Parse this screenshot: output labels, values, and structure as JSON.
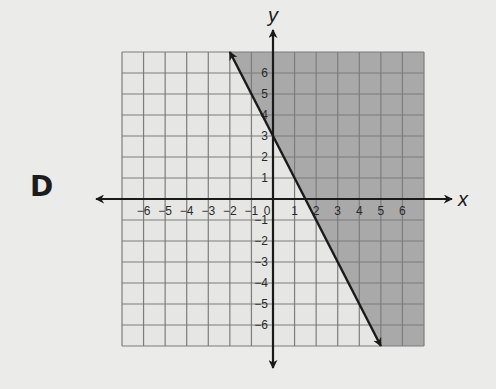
{
  "option_label": "D",
  "chart_data": {
    "type": "line",
    "title": "",
    "xlabel": "x",
    "ylabel": "y",
    "xlim": [
      -7,
      7
    ],
    "ylim": [
      -7,
      7
    ],
    "grid": true,
    "x_ticks": [
      -6,
      -5,
      -4,
      -3,
      -2,
      -1,
      0,
      1,
      2,
      3,
      4,
      5,
      6
    ],
    "y_ticks": [
      -6,
      -5,
      -4,
      -3,
      -2,
      -1,
      1,
      2,
      3,
      4,
      5,
      6
    ],
    "x_tick_labels": [
      "−6",
      "−5",
      "−4",
      "−3",
      "−2",
      "−1",
      "0",
      "1",
      "2",
      "3",
      "4",
      "5",
      "6"
    ],
    "y_tick_labels": [
      "−6",
      "−5",
      "−4",
      "−3",
      "−2",
      "−1",
      "1",
      "2",
      "3",
      "4",
      "5",
      "6"
    ],
    "series": [
      {
        "name": "boundary line y = -2x + 3",
        "style": "solid",
        "arrows": "both",
        "x": [
          -2,
          5
        ],
        "y": [
          7,
          -7
        ]
      }
    ],
    "inequality": "y ≥ -2x + 3",
    "shaded_region": "right of / above the line",
    "shading_color": "#a8a8a8",
    "grid_color": "#7a7a7a"
  },
  "colors": {
    "background": "#ebebea",
    "unshaded": "#e6e6e5",
    "shaded": "#a9a9a9",
    "grid": "#7d7d7d",
    "axis": "#1a1a1a"
  }
}
